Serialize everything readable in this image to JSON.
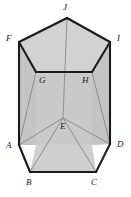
{
  "figure": {
    "type": "pentagonal-prism-diagram",
    "colors": {
      "background": "#ffffff",
      "front_face_fill": "#c9c9c9",
      "side_face_fill": "#c4c4c4",
      "top_face_fill": "#d2d2d2",
      "bottom_face_fill": "#cfcfcf",
      "outline": "#1c1c1c",
      "hidden_edge": "#8a8a8a",
      "label": "#1a1a1a"
    },
    "vertices": [
      {
        "name": "A",
        "label": "A",
        "x": 19,
        "y": 145,
        "label_x": 6,
        "label_y": 141,
        "hidden": false
      },
      {
        "name": "B",
        "label": "B",
        "x": 30,
        "y": 172,
        "label_x": 26,
        "label_y": 178,
        "hidden": false
      },
      {
        "name": "C",
        "label": "C",
        "x": 96,
        "y": 172,
        "label_x": 91,
        "label_y": 178,
        "hidden": false
      },
      {
        "name": "D",
        "label": "D",
        "x": 110,
        "y": 144,
        "label_x": 117,
        "label_y": 140,
        "hidden": false
      },
      {
        "name": "E",
        "label": "E",
        "x": 63,
        "y": 118,
        "label_x": 60,
        "label_y": 122,
        "hidden": true
      },
      {
        "name": "F",
        "label": "F",
        "x": 19,
        "y": 42,
        "label_x": 6,
        "label_y": 34,
        "hidden": false
      },
      {
        "name": "G",
        "label": "G",
        "x": 36,
        "y": 72,
        "label_x": 39,
        "label_y": 76,
        "hidden": true
      },
      {
        "name": "H",
        "label": "H",
        "x": 92,
        "y": 72,
        "label_x": 82,
        "label_y": 76,
        "hidden": true
      },
      {
        "name": "I",
        "label": "I",
        "x": 110,
        "y": 42,
        "label_x": 117,
        "label_y": 34,
        "hidden": false
      },
      {
        "name": "J",
        "label": "J",
        "x": 67,
        "y": 18,
        "label_x": 63,
        "label_y": 3,
        "hidden": false
      }
    ],
    "edges": [
      {
        "from": "A",
        "to": "B",
        "hidden": false
      },
      {
        "from": "B",
        "to": "C",
        "hidden": false
      },
      {
        "from": "C",
        "to": "D",
        "hidden": false
      },
      {
        "from": "D",
        "to": "I",
        "hidden": false
      },
      {
        "from": "I",
        "to": "J",
        "hidden": false
      },
      {
        "from": "J",
        "to": "F",
        "hidden": false
      },
      {
        "from": "F",
        "to": "A",
        "hidden": false
      },
      {
        "from": "F",
        "to": "G",
        "hidden": false
      },
      {
        "from": "G",
        "to": "H",
        "hidden": false
      },
      {
        "from": "H",
        "to": "I",
        "hidden": false
      },
      {
        "from": "G",
        "to": "A",
        "hidden": true
      },
      {
        "from": "H",
        "to": "D",
        "hidden": true
      },
      {
        "from": "E",
        "to": "J",
        "hidden": true
      },
      {
        "from": "E",
        "to": "A",
        "hidden": true
      },
      {
        "from": "E",
        "to": "D",
        "hidden": true
      },
      {
        "from": "E",
        "to": "B",
        "hidden": true
      },
      {
        "from": "E",
        "to": "C",
        "hidden": true
      }
    ],
    "faces": [
      {
        "name": "front-left-face",
        "points": "19,42 36,72 36,145 19,145",
        "fill_key": "side_face_fill"
      },
      {
        "name": "front-center-face",
        "points": "36,72 92,72 92,145 36,145",
        "fill_key": "front_face_fill"
      },
      {
        "name": "front-right-face",
        "points": "92,72 110,42 110,144 92,145",
        "fill_key": "side_face_fill"
      },
      {
        "name": "top-face",
        "points": "19,42 67,18 110,42 92,72 36,72",
        "fill_key": "top_face_fill"
      },
      {
        "name": "bottom-face",
        "points": "19,145 36,145 30,172 96,172 92,145 110,144",
        "fill_key": "bottom_face_fill"
      }
    ]
  }
}
